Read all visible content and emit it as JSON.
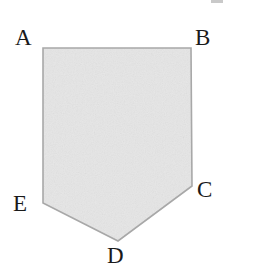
{
  "figure": {
    "type": "polygon-diagram",
    "background_color": "#ffffff",
    "canvas": {
      "width": 259,
      "height": 279
    },
    "shape": {
      "name": "pentagon-ABCDE",
      "fill_color": "#ececec",
      "stroke_color": "#a8a8a8",
      "stroke_width": 1.6,
      "texture": "light-noise-grain",
      "points": "43,48 191,48 192,186 118,241 43,203",
      "vertices": [
        {
          "id": "A",
          "x": 43,
          "y": 48
        },
        {
          "id": "B",
          "x": 191,
          "y": 48
        },
        {
          "id": "C",
          "x": 192,
          "y": 186
        },
        {
          "id": "D",
          "x": 118,
          "y": 241
        },
        {
          "id": "E",
          "x": 43,
          "y": 203
        }
      ]
    },
    "labels": {
      "A": "A",
      "B": "B",
      "C": "C",
      "D": "D",
      "E": "E"
    }
  }
}
